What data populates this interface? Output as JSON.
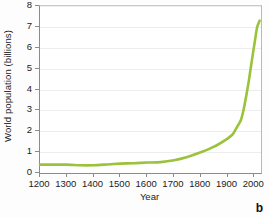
{
  "chart_data": {
    "type": "line",
    "title": "",
    "xlabel": "Year",
    "ylabel": "World population (billions)",
    "xlim": [
      1200,
      2025
    ],
    "ylim": [
      0,
      8
    ],
    "grid": true,
    "legend": null,
    "line_color": "#9ac23b",
    "line_width": 2.6,
    "xticks": [
      1200,
      1300,
      1400,
      1500,
      1600,
      1700,
      1800,
      1900,
      2000
    ],
    "xtick_labels": [
      "1200",
      "1300",
      "1400",
      "1500",
      "1600",
      "1700",
      "1800",
      "1900",
      "2000"
    ],
    "yticks": [
      0,
      1,
      2,
      3,
      4,
      5,
      6,
      7,
      8
    ],
    "ytick_labels": [
      "0",
      "1",
      "2",
      "3",
      "4",
      "5",
      "6",
      "7",
      "8"
    ],
    "series": [
      {
        "name": "World population",
        "x": [
          1200,
          1250,
          1300,
          1350,
          1400,
          1450,
          1500,
          1550,
          1600,
          1650,
          1700,
          1750,
          1800,
          1850,
          1900,
          1920,
          1940,
          1950,
          1960,
          1970,
          1980,
          1990,
          2000,
          2010,
          2020
        ],
        "y": [
          0.4,
          0.4,
          0.4,
          0.37,
          0.37,
          0.41,
          0.45,
          0.47,
          0.5,
          0.52,
          0.61,
          0.77,
          0.99,
          1.26,
          1.65,
          1.86,
          2.3,
          2.54,
          3.03,
          3.7,
          4.45,
          5.32,
          6.14,
          6.96,
          7.3
        ]
      }
    ],
    "annotations": [
      {
        "text": "b",
        "position": "bottom-right",
        "style": "bold"
      }
    ],
    "axis_color": "#8b8b8b",
    "gridline_color": "#ededed",
    "background": "#ffffff"
  },
  "figure": {
    "panel_label": "b"
  }
}
